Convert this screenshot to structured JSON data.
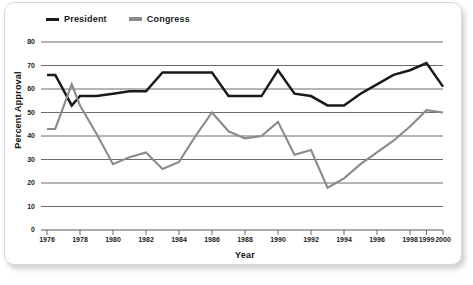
{
  "chart_data": {
    "type": "line",
    "title": "",
    "xlabel": "Year",
    "ylabel": "Percent Approval",
    "xlim": [
      1976,
      2000
    ],
    "ylim": [
      0,
      80
    ],
    "ytick_labels": [
      "80",
      "70",
      "60",
      "50",
      "40",
      "30",
      "20",
      "10",
      "0"
    ],
    "ytick_values": [
      80,
      70,
      60,
      50,
      40,
      30,
      20,
      10,
      0
    ],
    "xtick_labels": [
      "1976",
      "1978",
      "1980",
      "1982",
      "1984",
      "1986",
      "1988",
      "1990",
      "1992",
      "1994",
      "1996",
      "1998",
      "1999",
      "2000"
    ],
    "xtick_values": [
      1976,
      1978,
      1980,
      1982,
      1984,
      1986,
      1988,
      1990,
      1992,
      1994,
      1996,
      1998,
      1999,
      2000
    ],
    "grid": true,
    "legend_position": "top-left",
    "series": [
      {
        "name": "President",
        "color": "#1a1a1a",
        "x": [
          1976,
          1976.5,
          1977.5,
          1978,
          1979,
          1980,
          1981,
          1982,
          1983,
          1984,
          1985,
          1986,
          1987,
          1988,
          1989,
          1990,
          1991,
          1992,
          1993,
          1994,
          1995,
          1996,
          1997,
          1998,
          1999,
          2000
        ],
        "values": [
          66,
          66,
          53,
          57,
          57,
          58,
          59,
          59,
          67,
          67,
          67,
          67,
          57,
          57,
          57,
          68,
          58,
          57,
          53,
          53,
          58,
          62,
          66,
          68,
          71,
          61
        ]
      },
      {
        "name": "Congress",
        "color": "#8a8a8a",
        "x": [
          1976,
          1976.5,
          1977.5,
          1978,
          1979,
          1980,
          1981,
          1982,
          1983,
          1984,
          1985,
          1986,
          1987,
          1988,
          1989,
          1990,
          1991,
          1992,
          1993,
          1994,
          1995,
          1996,
          1997,
          1998,
          1999,
          2000
        ],
        "values": [
          43,
          43,
          62,
          53,
          41,
          28,
          31,
          33,
          26,
          29,
          40,
          50,
          42,
          39,
          40,
          46,
          32,
          34,
          18,
          22,
          28,
          33,
          38,
          44,
          51,
          50
        ]
      }
    ]
  },
  "legend": {
    "entries": [
      {
        "label": "President",
        "color": "#1a1a1a"
      },
      {
        "label": "Congress",
        "color": "#8a8a8a"
      }
    ]
  },
  "axes": {
    "x_title": "Year",
    "y_title": "Percent Approval"
  }
}
